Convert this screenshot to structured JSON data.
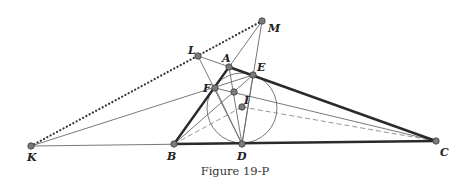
{
  "caption": "Figure 19-P",
  "points": {
    "A": {
      "label": "A",
      "x": 229,
      "y": 67
    },
    "B": {
      "label": "B",
      "x": 174,
      "y": 144
    },
    "C": {
      "label": "C",
      "x": 436,
      "y": 141
    },
    "D": {
      "label": "D",
      "x": 242,
      "y": 144
    },
    "E": {
      "label": "E",
      "x": 253,
      "y": 75
    },
    "F": {
      "label": "F",
      "x": 215,
      "y": 88
    },
    "I": {
      "label": "I",
      "x": 242,
      "y": 107
    },
    "K": {
      "label": "K",
      "x": 31,
      "y": 146
    },
    "L": {
      "label": "L",
      "x": 198,
      "y": 56
    },
    "M": {
      "label": "M",
      "x": 262,
      "y": 21
    },
    "P": {
      "label": "",
      "x": 234,
      "y": 92
    }
  },
  "incircle": {
    "center": "I",
    "radius": 36
  },
  "colors": {
    "thick": "#2a2a2a",
    "thin": "#6a6a6a",
    "point": "#7b7b7b"
  }
}
